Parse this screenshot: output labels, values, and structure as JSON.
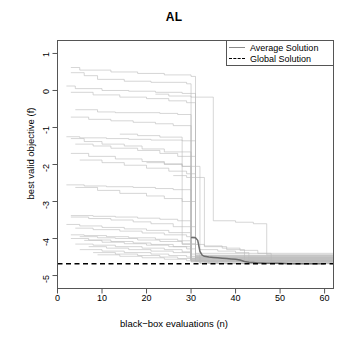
{
  "chart_data": {
    "type": "line",
    "title": "AL",
    "xlabel": "black−box evaluations (n)",
    "ylabel": "best valid objective (f)",
    "xlim": [
      0,
      62
    ],
    "ylim": [
      -5.35,
      1.35
    ],
    "xticks": [
      0,
      10,
      20,
      30,
      40,
      50,
      60
    ],
    "xtick_labels": [
      "0",
      "10",
      "20",
      "30",
      "40",
      "50",
      "60"
    ],
    "yticks": [
      1,
      0,
      -1,
      -2,
      -3,
      -4,
      -5
    ],
    "ytick_labels": [
      "1",
      "0",
      "-1",
      "-2",
      "-3",
      "-4",
      "-5"
    ],
    "grid": false,
    "legend_position": "top-right",
    "legend": [
      {
        "name": "Average Solution",
        "style": "solid",
        "color": "#8a8a8a"
      },
      {
        "name": "Global Solution",
        "style": "dashed",
        "color": "#000000"
      }
    ],
    "global_solution_value": -4.68,
    "series": [
      {
        "name": "Average Solution",
        "style": "solid",
        "color": "#6e6e6e",
        "x": [
          30,
          31,
          31.5,
          32,
          32.5,
          33,
          34,
          35,
          36,
          37,
          38,
          39,
          40,
          41,
          42,
          43,
          44,
          45,
          46,
          47,
          48,
          50,
          52,
          54,
          56,
          58,
          60
        ],
        "y": [
          -3.97,
          -3.98,
          -4.05,
          -4.35,
          -4.45,
          -4.48,
          -4.5,
          -4.51,
          -4.52,
          -4.53,
          -4.54,
          -4.55,
          -4.56,
          -4.58,
          -4.62,
          -4.64,
          -4.65,
          -4.66,
          -4.66,
          -4.67,
          -4.67,
          -4.67,
          -4.68,
          -4.68,
          -4.68,
          -4.68,
          -4.68
        ]
      },
      {
        "name": "Global Solution",
        "style": "dashed",
        "color": "#000000",
        "x": [
          0,
          62
        ],
        "y": [
          -4.68,
          -4.68
        ]
      }
    ],
    "runs_note": "30 individual light-gray monotone step trajectories of best valid objective per run",
    "runs": [
      {
        "x": [
          3,
          5,
          12,
          18,
          24,
          30,
          31,
          62
        ],
        "y": [
          0.62,
          0.55,
          0.5,
          0.46,
          0.42,
          0.38,
          -4.52,
          -4.52
        ]
      },
      {
        "x": [
          3,
          6,
          9,
          15,
          21,
          29,
          30,
          62
        ],
        "y": [
          0.48,
          0.4,
          0.3,
          0.25,
          0.22,
          0.18,
          -4.55,
          -4.55
        ]
      },
      {
        "x": [
          2,
          4,
          10,
          16,
          22,
          28,
          31,
          62
        ],
        "y": [
          0.12,
          0.05,
          0.0,
          -0.02,
          -0.05,
          -0.08,
          -4.6,
          -4.6
        ]
      },
      {
        "x": [
          3,
          8,
          14,
          20,
          25,
          29,
          31,
          62
        ],
        "y": [
          -0.05,
          -0.12,
          -0.18,
          -0.22,
          -0.28,
          -0.33,
          -4.5,
          -4.5
        ]
      },
      {
        "x": [
          4,
          9,
          13,
          19,
          23,
          27,
          30,
          62
        ],
        "y": [
          -0.52,
          -0.58,
          -0.6,
          -0.6,
          -0.62,
          -0.65,
          -4.48,
          -4.48
        ]
      },
      {
        "x": [
          3,
          7,
          12,
          17,
          22,
          26,
          30,
          62
        ],
        "y": [
          -0.72,
          -0.78,
          -0.82,
          -0.86,
          -0.9,
          -0.95,
          -4.58,
          -4.58
        ]
      },
      {
        "x": [
          2,
          5,
          11,
          16,
          21,
          28,
          31,
          62
        ],
        "y": [
          -1.25,
          -1.28,
          -1.3,
          -1.32,
          -1.34,
          -1.36,
          -4.45,
          -4.45
        ]
      },
      {
        "x": [
          3,
          6,
          10,
          15,
          19,
          24,
          30,
          62
        ],
        "y": [
          -1.3,
          -1.38,
          -1.45,
          -1.5,
          -1.58,
          -1.66,
          -4.62,
          -4.62
        ]
      },
      {
        "x": [
          4,
          8,
          12,
          18,
          23,
          27,
          31,
          62
        ],
        "y": [
          -1.45,
          -1.5,
          -1.56,
          -1.62,
          -1.7,
          -1.78,
          -4.4,
          -4.4
        ]
      },
      {
        "x": [
          3,
          7,
          13,
          19,
          24,
          28,
          30,
          62
        ],
        "y": [
          -1.7,
          -1.78,
          -1.85,
          -1.92,
          -1.98,
          -2.05,
          -4.55,
          -4.55
        ]
      },
      {
        "x": [
          5,
          10,
          15,
          20,
          25,
          29,
          31,
          62
        ],
        "y": [
          -1.88,
          -1.95,
          -2.02,
          -2.1,
          -2.18,
          -2.25,
          -4.5,
          -4.5
        ]
      },
      {
        "x": [
          2,
          6,
          11,
          17,
          22,
          26,
          30,
          62
        ],
        "y": [
          -2.55,
          -2.58,
          -2.6,
          -2.62,
          -2.65,
          -2.68,
          -4.6,
          -4.6
        ]
      },
      {
        "x": [
          4,
          9,
          14,
          20,
          24,
          28,
          31,
          62
        ],
        "y": [
          -2.62,
          -2.7,
          -2.78,
          -2.85,
          -2.92,
          -3.0,
          -4.52,
          -4.52
        ]
      },
      {
        "x": [
          3,
          8,
          13,
          18,
          23,
          27,
          30,
          62
        ],
        "y": [
          -3.38,
          -3.4,
          -3.42,
          -3.45,
          -3.48,
          -3.52,
          -4.58,
          -4.58
        ]
      },
      {
        "x": [
          3,
          7,
          12,
          17,
          21,
          26,
          31,
          62
        ],
        "y": [
          -3.42,
          -3.46,
          -3.5,
          -3.55,
          -3.6,
          -3.68,
          -4.46,
          -4.46
        ]
      },
      {
        "x": [
          2,
          5,
          10,
          15,
          20,
          25,
          30,
          62
        ],
        "y": [
          -3.62,
          -3.66,
          -3.7,
          -3.74,
          -3.78,
          -3.84,
          -4.55,
          -4.55
        ]
      },
      {
        "x": [
          4,
          8,
          14,
          19,
          24,
          29,
          31,
          62
        ],
        "y": [
          -3.72,
          -3.76,
          -3.8,
          -3.85,
          -3.9,
          -3.95,
          -4.62,
          -4.62
        ]
      },
      {
        "x": [
          3,
          6,
          11,
          16,
          22,
          27,
          30,
          62
        ],
        "y": [
          -3.9,
          -3.92,
          -3.95,
          -3.98,
          -4.02,
          -4.06,
          -4.58,
          -4.58
        ]
      },
      {
        "x": [
          5,
          9,
          13,
          18,
          23,
          28,
          31,
          62
        ],
        "y": [
          -3.95,
          -3.98,
          -4.0,
          -4.04,
          -4.08,
          -4.14,
          -4.5,
          -4.5
        ]
      },
      {
        "x": [
          3,
          7,
          12,
          17,
          21,
          26,
          30,
          62
        ],
        "y": [
          -4.0,
          -4.04,
          -4.08,
          -4.12,
          -4.16,
          -4.22,
          -4.6,
          -4.6
        ]
      },
      {
        "x": [
          6,
          10,
          15,
          20,
          25,
          29,
          31,
          62
        ],
        "y": [
          -4.05,
          -4.1,
          -4.14,
          -4.18,
          -4.22,
          -4.28,
          -4.55,
          -4.55
        ]
      },
      {
        "x": [
          4,
          8,
          13,
          19,
          24,
          28,
          30,
          62
        ],
        "y": [
          -4.15,
          -4.18,
          -4.22,
          -4.26,
          -4.3,
          -4.36,
          -4.63,
          -4.63
        ]
      },
      {
        "x": [
          7,
          11,
          16,
          21,
          26,
          30,
          32,
          62
        ],
        "y": [
          -4.22,
          -4.26,
          -4.3,
          -4.34,
          -4.38,
          -4.42,
          -4.66,
          -4.66
        ]
      },
      {
        "x": [
          5,
          10,
          15,
          21,
          25,
          29,
          32,
          62
        ],
        "y": [
          -4.3,
          -4.34,
          -4.38,
          -4.42,
          -4.46,
          -4.5,
          -4.67,
          -4.67
        ]
      },
      {
        "x": [
          8,
          13,
          18,
          23,
          27,
          31,
          34,
          62
        ],
        "y": [
          -4.38,
          -4.42,
          -4.46,
          -4.5,
          -4.54,
          -4.58,
          -4.67,
          -4.67
        ]
      },
      {
        "x": [
          9,
          14,
          19,
          24,
          29,
          33,
          36,
          62
        ],
        "y": [
          -4.44,
          -4.48,
          -4.52,
          -4.56,
          -4.6,
          -4.64,
          -4.68,
          -4.68
        ]
      },
      {
        "x": [
          22,
          25,
          30,
          35,
          40,
          44,
          47,
          62
        ],
        "y": [
          -0.1,
          -0.15,
          -0.18,
          -3.52,
          -3.56,
          -3.6,
          -4.44,
          -4.44
        ]
      },
      {
        "x": [
          20,
          24,
          28,
          32,
          36,
          40,
          43,
          62
        ],
        "y": [
          -1.95,
          -2.0,
          -2.05,
          -4.3,
          -4.34,
          -4.38,
          -4.64,
          -4.64
        ]
      },
      {
        "x": [
          26,
          29,
          33,
          37,
          41,
          45,
          48,
          62
        ],
        "y": [
          -2.3,
          -2.35,
          -4.2,
          -4.26,
          -4.32,
          -4.4,
          -4.66,
          -4.66
        ]
      },
      {
        "x": [
          14,
          18,
          23,
          28,
          33,
          38,
          42,
          62
        ],
        "y": [
          -1.18,
          -1.22,
          -1.26,
          -4.16,
          -4.22,
          -4.3,
          -4.58,
          -4.58
        ]
      }
    ]
  }
}
